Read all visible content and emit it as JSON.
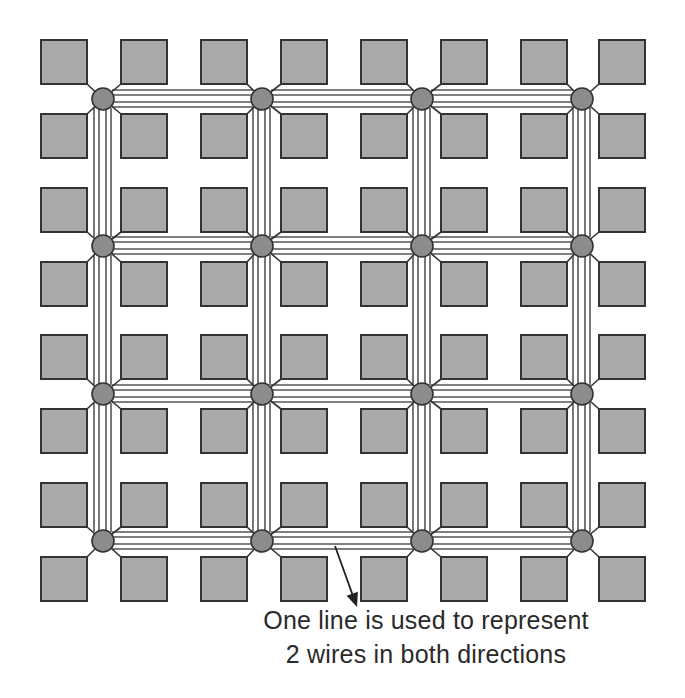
{
  "diagram": {
    "colors": {
      "background": "#ffffff",
      "block_fill": "#a9a9a9",
      "block_stroke": "#333333",
      "node_fill": "#8c8c8c",
      "node_stroke": "#333333",
      "wire": "#555555",
      "arrow": "#222222",
      "text": "#2a2a2a"
    },
    "blocks": {
      "columns_x": [
        41,
        121,
        201,
        281,
        361,
        441,
        521,
        599
      ],
      "rows_y": [
        40,
        114,
        188,
        262,
        335,
        409,
        483,
        557
      ],
      "width": 46,
      "height": 44
    },
    "switch_nodes": {
      "columns_x": [
        103,
        262,
        422,
        582
      ],
      "rows_y": [
        99,
        246,
        394,
        541
      ],
      "radius": 11
    },
    "channels": {
      "wires_per_channel": 4,
      "wire_offsets": [
        -9,
        -4,
        3,
        8
      ]
    },
    "annotation": {
      "arrow": {
        "from": [
          335,
          546
        ],
        "to": [
          357,
          607
        ]
      },
      "lines": [
        "One line is used to represent",
        "2 wires in both directions"
      ]
    }
  }
}
